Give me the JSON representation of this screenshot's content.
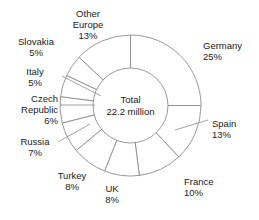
{
  "chart_data": {
    "type": "pie",
    "variant": "donut",
    "title": "",
    "subtitle": "",
    "xlabel": "",
    "ylabel": "",
    "legend_position": "none",
    "grid": false,
    "center_label": {
      "line1": "Total",
      "line2": "22.2 million"
    },
    "units": "percent of 22.2 million",
    "start_angle_deg": 0,
    "direction": "clockwise",
    "categories": [
      "Germany",
      "Spain",
      "France",
      "UK",
      "Turkey",
      "Russia",
      "Czech Republic",
      "Italy",
      "Slovakia",
      "Other Europe"
    ],
    "values": [
      25,
      13,
      10,
      8,
      8,
      7,
      6,
      5,
      5,
      13
    ],
    "value_labels": [
      "25%",
      "13%",
      "10%",
      "8%",
      "8%",
      "7%",
      "6%",
      "5%",
      "5%",
      "13%"
    ],
    "total_value_label": "100%",
    "slice_fill": "#ffffff",
    "slice_stroke": "#8c8c8c",
    "text_color": "#1a1a1a",
    "background": "#ffffff"
  },
  "labels": [
    {
      "key": "germany",
      "name": "Germany",
      "value": "25%",
      "leader": false
    },
    {
      "key": "spain",
      "name": "Spain",
      "value": "13%",
      "leader": true
    },
    {
      "key": "france",
      "name": "France",
      "value": "10%",
      "leader": false
    },
    {
      "key": "uk",
      "name": "UK",
      "value": "8%",
      "leader": false
    },
    {
      "key": "turkey",
      "name": "Turkey",
      "value": "8%",
      "leader": false
    },
    {
      "key": "russia",
      "name": "Russia",
      "value": "7%",
      "leader": true
    },
    {
      "key": "czech-republic",
      "name1": "Czech",
      "name2": "Republic",
      "value": "6%",
      "leader": true
    },
    {
      "key": "italy",
      "name": "Italy",
      "value": "5%",
      "leader": true
    },
    {
      "key": "slovakia",
      "name": "Slovakia",
      "value": "5%",
      "leader": false
    },
    {
      "key": "other-europe",
      "name1": "Other",
      "name2": "Europe",
      "value": "13%",
      "leader": false
    }
  ]
}
